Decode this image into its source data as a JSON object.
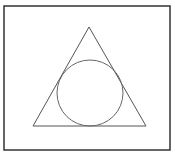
{
  "diagram": {
    "canvas": {
      "width": 175,
      "height": 161,
      "background": "#ffffff"
    },
    "stroke_color": "#555555",
    "frame": {
      "x": 4,
      "y": 6,
      "width": 166,
      "height": 144,
      "stroke_width": 1.5,
      "stroke_color": "#333333"
    },
    "triangle": {
      "points": [
        [
          89,
          27
        ],
        [
          33,
          126
        ],
        [
          146,
          126
        ]
      ],
      "stroke_width": 1,
      "stroke_color": "#555555"
    },
    "circle": {
      "cx": 90,
      "cy": 93,
      "r": 33,
      "stroke_width": 1,
      "stroke_color": "#666666"
    }
  }
}
